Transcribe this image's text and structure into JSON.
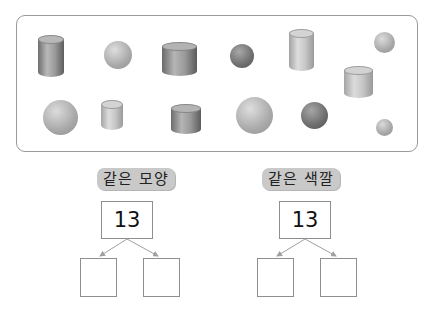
{
  "panel": {
    "shapes": [
      {
        "type": "cylinder",
        "size": "tall",
        "shade": "dark",
        "x": 38,
        "y": 35
      },
      {
        "type": "sphere",
        "size": "medium",
        "shade": "light",
        "x": 104,
        "y": 41
      },
      {
        "type": "cylinder",
        "size": "wide",
        "shade": "dark",
        "x": 162,
        "y": 42
      },
      {
        "type": "sphere",
        "size": "small",
        "shade": "dark",
        "x": 230,
        "y": 44
      },
      {
        "type": "cylinder",
        "size": "tall",
        "shade": "light",
        "x": 289,
        "y": 29
      },
      {
        "type": "sphere",
        "size": "small",
        "shade": "light",
        "x": 374,
        "y": 32
      },
      {
        "type": "cylinder",
        "size": "wide",
        "shade": "light",
        "x": 344,
        "y": 66
      },
      {
        "type": "sphere",
        "size": "large",
        "shade": "light",
        "x": 43,
        "y": 100
      },
      {
        "type": "cylinder",
        "size": "short",
        "shade": "light",
        "x": 101,
        "y": 100
      },
      {
        "type": "cylinder",
        "size": "short-wide",
        "shade": "dark",
        "x": 171,
        "y": 104
      },
      {
        "type": "sphere",
        "size": "large",
        "shade": "light",
        "x": 236,
        "y": 97
      },
      {
        "type": "sphere",
        "size": "medium",
        "shade": "dark",
        "x": 301,
        "y": 102
      },
      {
        "type": "sphere",
        "size": "tiny",
        "shade": "light",
        "x": 376,
        "y": 119
      }
    ]
  },
  "groups": [
    {
      "label": "같은 모양",
      "total": "13",
      "answers": [
        "",
        ""
      ]
    },
    {
      "label": "같은 색깔",
      "total": "13",
      "answers": [
        "",
        ""
      ]
    }
  ],
  "colors": {
    "pill_bg": "#c9c9c9",
    "border": "#8e8e8e",
    "arrow": "#a0a0a0"
  }
}
